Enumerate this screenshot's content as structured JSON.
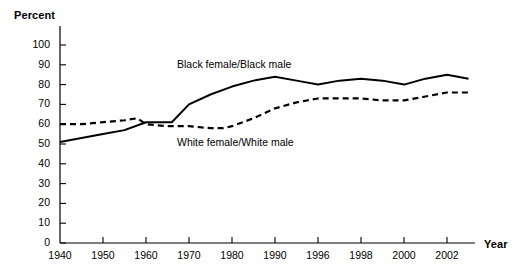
{
  "chart_data": {
    "type": "line",
    "title": "",
    "xlabel": "Year",
    "ylabel": "Percent",
    "ylim": [
      0,
      100
    ],
    "xlim": [
      1940,
      2003
    ],
    "grid": false,
    "legend_position": "inline-annotations",
    "y_ticks": [
      100,
      90,
      80,
      70,
      60,
      50,
      40,
      30,
      20,
      10,
      0
    ],
    "x_ticks": [
      1940,
      1950,
      1960,
      1970,
      1980,
      1990,
      1996,
      1998,
      2000,
      2002
    ],
    "x_tick_labels": [
      "1940",
      "1950",
      "1960",
      "1970",
      "1980",
      "1990",
      "1996",
      "1998",
      "2000",
      "2002"
    ],
    "x_axis_note": "axis uses irregular (non-linear) tick spacing: decades 1940-1990 then 1996, 1998, 2000, 2002 evenly spaced",
    "series": [
      {
        "name": "Black female/Black male",
        "label": "Black female/Black male",
        "style": "solid",
        "color": "#000000",
        "annotation_x": 1972,
        "annotation_y": 90,
        "x": [
          1940,
          1945,
          1950,
          1955,
          1960,
          1963,
          1966,
          1970,
          1975,
          1980,
          1985,
          1990,
          1993,
          1996,
          1997,
          1998,
          1999,
          2000,
          2001,
          2002,
          2003
        ],
        "values": [
          51,
          53,
          55,
          57,
          61,
          61,
          61,
          70,
          75,
          79,
          82,
          84,
          82,
          80,
          82,
          83,
          82,
          80,
          83,
          85,
          83
        ]
      },
      {
        "name": "White female/White male",
        "label": "White female/White male",
        "style": "dashed",
        "color": "#000000",
        "annotation_x": 1972,
        "annotation_y": 52,
        "x": [
          1940,
          1945,
          1950,
          1955,
          1958,
          1960,
          1965,
          1970,
          1975,
          1978,
          1980,
          1985,
          1990,
          1993,
          1996,
          1997,
          1998,
          1999,
          2000,
          2001,
          2002,
          2003
        ],
        "values": [
          60,
          60,
          61,
          62,
          63,
          60,
          59,
          59,
          58,
          58,
          59,
          63,
          68,
          71,
          73,
          73,
          73,
          72,
          72,
          74,
          76,
          76
        ]
      }
    ]
  },
  "axes": {
    "y_title": "Percent",
    "x_title": "Year"
  }
}
